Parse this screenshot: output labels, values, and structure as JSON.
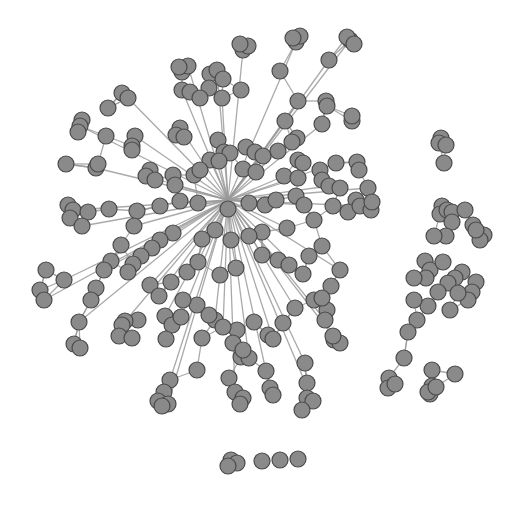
{
  "diagram": {
    "type": "network-graph",
    "background": "#ffffff",
    "node_fill": "#8a8a8a",
    "node_stroke": "#4a4a4a",
    "edge_color": "#9a9a9a",
    "node_radius": 8,
    "components": [
      {
        "name": "main-cluster",
        "description": "large dense hairball on left/center"
      },
      {
        "name": "right-cluster",
        "description": "elongated vertical component on right"
      },
      {
        "name": "isolates-bottom",
        "description": "small group of isolated nodes at bottom center"
      }
    ]
  },
  "graph": {
    "nodes": [
      [
        243,
        50
      ],
      [
        248,
        46
      ],
      [
        240,
        44
      ],
      [
        296,
        42
      ],
      [
        300,
        36
      ],
      [
        293,
        38
      ],
      [
        350,
        40
      ],
      [
        347,
        37
      ],
      [
        354,
        44
      ],
      [
        329,
        60
      ],
      [
        280,
        71
      ],
      [
        182,
        72
      ],
      [
        188,
        66
      ],
      [
        179,
        67
      ],
      [
        210,
        74
      ],
      [
        217,
        70
      ],
      [
        223,
        79
      ],
      [
        209,
        88
      ],
      [
        182,
        90
      ],
      [
        190,
        92
      ],
      [
        200,
        98
      ],
      [
        222,
        98
      ],
      [
        241,
        90
      ],
      [
        122,
        93
      ],
      [
        128,
        98
      ],
      [
        108,
        108
      ],
      [
        82,
        120
      ],
      [
        80,
        126
      ],
      [
        78,
        132
      ],
      [
        106,
        136
      ],
      [
        135,
        136
      ],
      [
        132,
        146
      ],
      [
        132,
        150
      ],
      [
        180,
        128
      ],
      [
        176,
        135
      ],
      [
        184,
        137
      ],
      [
        298,
        101
      ],
      [
        326,
        101
      ],
      [
        327,
        106
      ],
      [
        322,
        124
      ],
      [
        352,
        121
      ],
      [
        352,
        116
      ],
      [
        285,
        121
      ],
      [
        297,
        138
      ],
      [
        292,
        142
      ],
      [
        278,
        151
      ],
      [
        246,
        147
      ],
      [
        255,
        152
      ],
      [
        263,
        156
      ],
      [
        218,
        140
      ],
      [
        224,
        152
      ],
      [
        210,
        160
      ],
      [
        230,
        153
      ],
      [
        66,
        164
      ],
      [
        96,
        168
      ],
      [
        98,
        164
      ],
      [
        150,
        170
      ],
      [
        146,
        176
      ],
      [
        155,
        180
      ],
      [
        173,
        175
      ],
      [
        175,
        185
      ],
      [
        194,
        175
      ],
      [
        200,
        170
      ],
      [
        219,
        161
      ],
      [
        243,
        169
      ],
      [
        256,
        172
      ],
      [
        284,
        176
      ],
      [
        298,
        160
      ],
      [
        303,
        163
      ],
      [
        298,
        178
      ],
      [
        320,
        170
      ],
      [
        322,
        180
      ],
      [
        336,
        163
      ],
      [
        357,
        162
      ],
      [
        359,
        170
      ],
      [
        368,
        188
      ],
      [
        356,
        200
      ],
      [
        348,
        212
      ],
      [
        360,
        206
      ],
      [
        371,
        210
      ],
      [
        372,
        202
      ],
      [
        329,
        186
      ],
      [
        340,
        188
      ],
      [
        68,
        205
      ],
      [
        73,
        210
      ],
      [
        70,
        218
      ],
      [
        88,
        212
      ],
      [
        82,
        226
      ],
      [
        109,
        209
      ],
      [
        137,
        211
      ],
      [
        134,
        226
      ],
      [
        160,
        206
      ],
      [
        180,
        201
      ],
      [
        198,
        203
      ],
      [
        228,
        209
      ],
      [
        249,
        203
      ],
      [
        265,
        205
      ],
      [
        276,
        200
      ],
      [
        296,
        196
      ],
      [
        304,
        205
      ],
      [
        333,
        206
      ],
      [
        314,
        220
      ],
      [
        287,
        228
      ],
      [
        262,
        232
      ],
      [
        249,
        236
      ],
      [
        231,
        240
      ],
      [
        215,
        230
      ],
      [
        202,
        239
      ],
      [
        173,
        233
      ],
      [
        160,
        240
      ],
      [
        152,
        248
      ],
      [
        141,
        256
      ],
      [
        121,
        245
      ],
      [
        111,
        261
      ],
      [
        104,
        270
      ],
      [
        96,
        288
      ],
      [
        91,
        300
      ],
      [
        79,
        322
      ],
      [
        74,
        344
      ],
      [
        80,
        348
      ],
      [
        64,
        280
      ],
      [
        46,
        270
      ],
      [
        40,
        290
      ],
      [
        44,
        300
      ],
      [
        133,
        264
      ],
      [
        128,
        272
      ],
      [
        150,
        285
      ],
      [
        171,
        282
      ],
      [
        187,
        272
      ],
      [
        198,
        262
      ],
      [
        220,
        275
      ],
      [
        236,
        268
      ],
      [
        262,
        255
      ],
      [
        278,
        260
      ],
      [
        289,
        265
      ],
      [
        303,
        274
      ],
      [
        309,
        256
      ],
      [
        322,
        246
      ],
      [
        340,
        270
      ],
      [
        331,
        286
      ],
      [
        314,
        300
      ],
      [
        295,
        308
      ],
      [
        283,
        323
      ],
      [
        268,
        335
      ],
      [
        273,
        339
      ],
      [
        254,
        322
      ],
      [
        237,
        330
      ],
      [
        215,
        320
      ],
      [
        197,
        305
      ],
      [
        183,
        300
      ],
      [
        159,
        296
      ],
      [
        138,
        320
      ],
      [
        125,
        321
      ],
      [
        122,
        325
      ],
      [
        119,
        336
      ],
      [
        132,
        338
      ],
      [
        165,
        316
      ],
      [
        172,
        325
      ],
      [
        166,
        339
      ],
      [
        181,
        317
      ],
      [
        209,
        315
      ],
      [
        202,
        338
      ],
      [
        223,
        327
      ],
      [
        233,
        343
      ],
      [
        241,
        357
      ],
      [
        249,
        358
      ],
      [
        243,
        350
      ],
      [
        197,
        370
      ],
      [
        170,
        380
      ],
      [
        164,
        392
      ],
      [
        158,
        401
      ],
      [
        168,
        404
      ],
      [
        162,
        406
      ],
      [
        229,
        378
      ],
      [
        235,
        392
      ],
      [
        243,
        398
      ],
      [
        240,
        404
      ],
      [
        266,
        371
      ],
      [
        270,
        388
      ],
      [
        273,
        395
      ],
      [
        305,
        363
      ],
      [
        307,
        383
      ],
      [
        307,
        398
      ],
      [
        313,
        401
      ],
      [
        302,
        410
      ],
      [
        327,
        310
      ],
      [
        325,
        320
      ],
      [
        334,
        340
      ],
      [
        340,
        343
      ],
      [
        333,
        336
      ],
      [
        322,
        298
      ],
      [
        441,
        138
      ],
      [
        439,
        143
      ],
      [
        446,
        145
      ],
      [
        444,
        163
      ],
      [
        442,
        206
      ],
      [
        440,
        214
      ],
      [
        447,
        210
      ],
      [
        452,
        212
      ],
      [
        452,
        222
      ],
      [
        465,
        210
      ],
      [
        473,
        225
      ],
      [
        484,
        235
      ],
      [
        480,
        240
      ],
      [
        476,
        230
      ],
      [
        446,
        236
      ],
      [
        434,
        236
      ],
      [
        425,
        261
      ],
      [
        430,
        270
      ],
      [
        426,
        278
      ],
      [
        414,
        278
      ],
      [
        443,
        262
      ],
      [
        462,
        272
      ],
      [
        455,
        278
      ],
      [
        476,
        282
      ],
      [
        472,
        292
      ],
      [
        468,
        300
      ],
      [
        448,
        283
      ],
      [
        438,
        292
      ],
      [
        458,
        293
      ],
      [
        450,
        310
      ],
      [
        428,
        306
      ],
      [
        414,
        300
      ],
      [
        417,
        320
      ],
      [
        408,
        332
      ],
      [
        404,
        358
      ],
      [
        389,
        378
      ],
      [
        388,
        388
      ],
      [
        395,
        384
      ],
      [
        432,
        370
      ],
      [
        432,
        386
      ],
      [
        430,
        394
      ],
      [
        428,
        392
      ],
      [
        436,
        387
      ],
      [
        455,
        374
      ],
      [
        231,
        460
      ],
      [
        237,
        463
      ],
      [
        228,
        466
      ],
      [
        262,
        461
      ],
      [
        280,
        460
      ],
      [
        298,
        459
      ]
    ]
  }
}
